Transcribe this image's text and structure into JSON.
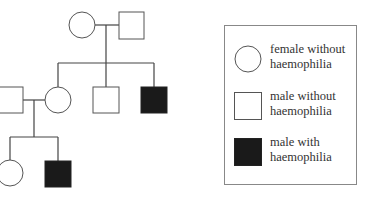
{
  "diagram": {
    "type": "pedigree",
    "colors": {
      "affected": "#1a1a1a",
      "unaffected": "#ffffff",
      "line": "#444444"
    },
    "individuals": [
      {
        "id": "I-1",
        "generation": 1,
        "sex": "female",
        "affected": false
      },
      {
        "id": "I-2",
        "generation": 1,
        "sex": "male",
        "affected": false
      },
      {
        "id": "II-1",
        "generation": 2,
        "sex": "male",
        "affected": false,
        "note": "married in"
      },
      {
        "id": "II-2",
        "generation": 2,
        "sex": "female",
        "affected": false
      },
      {
        "id": "II-3",
        "generation": 2,
        "sex": "male",
        "affected": false
      },
      {
        "id": "II-4",
        "generation": 2,
        "sex": "male",
        "affected": true
      },
      {
        "id": "III-1",
        "generation": 3,
        "sex": "female",
        "affected": false
      },
      {
        "id": "III-2",
        "generation": 3,
        "sex": "male",
        "affected": true
      }
    ],
    "matings": [
      {
        "partners": [
          "I-1",
          "I-2"
        ],
        "children": [
          "II-2",
          "II-3",
          "II-4"
        ]
      },
      {
        "partners": [
          "II-1",
          "II-2"
        ],
        "children": [
          "III-1",
          "III-2"
        ]
      }
    ]
  },
  "legend": {
    "items": [
      {
        "symbol": "circle-open",
        "line1": "female without",
        "line2": "haemophilia"
      },
      {
        "symbol": "square-open",
        "line1": "male without",
        "line2": "haemophilia"
      },
      {
        "symbol": "square-filled",
        "line1": "male with",
        "line2": "haemophilia"
      }
    ]
  }
}
